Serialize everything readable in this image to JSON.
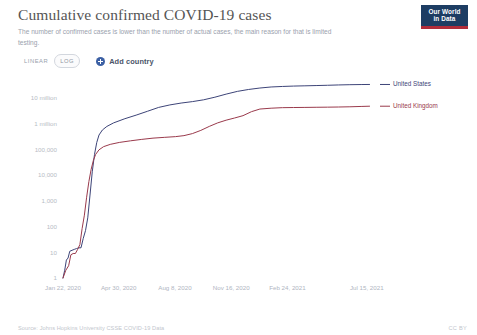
{
  "header": {
    "title": "Cumulative confirmed COVID-19 cases",
    "subtitle": "The number of confirmed cases is lower than the number of actual cases, the main reason for that is limited testing.",
    "logo_line1": "Our World",
    "logo_line2": "in Data",
    "logo_bg": "#1d3d63",
    "logo_accent": "#b02c3a"
  },
  "controls": {
    "scale_linear_label": "LINEAR",
    "scale_log_label": "LOG",
    "scale_selected": "LOG",
    "add_country_label": "Add country",
    "add_country_icon": "plus-circle-icon",
    "accent": "#3c60a4"
  },
  "footer": {
    "source": "Source: Johns Hopkins University CSSE COVID-19 Data",
    "license": "CC BY"
  },
  "chart_data": {
    "type": "line",
    "title": "Cumulative confirmed COVID-19 cases",
    "subtitle": "The number of confirmed cases is lower than the number of actual cases, the main reason for that is limited testing.",
    "xlabel": "",
    "ylabel": "",
    "yscale": "log",
    "ylim": [
      1,
      30000000
    ],
    "grid": false,
    "legend_position": "right-inline",
    "ytick_values": [
      1,
      10,
      100,
      1000,
      10000,
      100000,
      1000000,
      10000000
    ],
    "ytick_labels": [
      "1",
      "10",
      "100",
      "1,000",
      "10,000",
      "100,000",
      "1 million",
      "10 million"
    ],
    "xtick_labels": [
      "Jan 22, 2020",
      "Apr 30, 2020",
      "Aug 8, 2020",
      "Nov 16, 2020",
      "Feb 24, 2021",
      "Jul 15, 2021"
    ],
    "xtick_positions": [
      0,
      99,
      199,
      299,
      399,
      540
    ],
    "x_range": [
      0,
      560
    ],
    "series": [
      {
        "name": "United States",
        "color": "#3d4478",
        "label_color": "#3d4478",
        "points": [
          [
            0,
            1
          ],
          [
            3,
            2
          ],
          [
            6,
            5
          ],
          [
            9,
            6
          ],
          [
            12,
            11
          ],
          [
            16,
            12
          ],
          [
            20,
            13
          ],
          [
            24,
            14
          ],
          [
            28,
            15
          ],
          [
            32,
            15
          ],
          [
            36,
            35
          ],
          [
            40,
            70
          ],
          [
            44,
            220
          ],
          [
            48,
            1700
          ],
          [
            52,
            13700
          ],
          [
            56,
            65000
          ],
          [
            60,
            190000
          ],
          [
            64,
            370000
          ],
          [
            70,
            580000
          ],
          [
            78,
            800000
          ],
          [
            90,
            1100000
          ],
          [
            110,
            1600000
          ],
          [
            130,
            2200000
          ],
          [
            150,
            3100000
          ],
          [
            170,
            4400000
          ],
          [
            190,
            5500000
          ],
          [
            210,
            6500000
          ],
          [
            230,
            7400000
          ],
          [
            250,
            8700000
          ],
          [
            270,
            11000000
          ],
          [
            290,
            14500000
          ],
          [
            310,
            18500000
          ],
          [
            330,
            22000000
          ],
          [
            350,
            25000000
          ],
          [
            370,
            27500000
          ],
          [
            390,
            28800000
          ],
          [
            410,
            29800000
          ],
          [
            430,
            30500000
          ],
          [
            450,
            31200000
          ],
          [
            470,
            32000000
          ],
          [
            490,
            33000000
          ],
          [
            510,
            33700000
          ],
          [
            530,
            34200000
          ],
          [
            545,
            34400000
          ]
        ]
      },
      {
        "name": "United Kingdom",
        "color": "#9a3a4c",
        "label_color": "#9a3a4c",
        "points": [
          [
            0,
            1
          ],
          [
            5,
            2
          ],
          [
            10,
            3
          ],
          [
            14,
            8
          ],
          [
            18,
            9
          ],
          [
            22,
            9
          ],
          [
            26,
            13
          ],
          [
            30,
            20
          ],
          [
            34,
            85
          ],
          [
            38,
            280
          ],
          [
            42,
            1400
          ],
          [
            46,
            5700
          ],
          [
            50,
            17000
          ],
          [
            54,
            38000
          ],
          [
            58,
            65000
          ],
          [
            64,
            98000
          ],
          [
            72,
            130000
          ],
          [
            84,
            160000
          ],
          [
            100,
            190000
          ],
          [
            120,
            220000
          ],
          [
            140,
            250000
          ],
          [
            160,
            280000
          ],
          [
            180,
            300000
          ],
          [
            200,
            320000
          ],
          [
            215,
            350000
          ],
          [
            230,
            420000
          ],
          [
            245,
            560000
          ],
          [
            260,
            800000
          ],
          [
            275,
            1100000
          ],
          [
            290,
            1400000
          ],
          [
            305,
            1700000
          ],
          [
            320,
            2100000
          ],
          [
            335,
            3000000
          ],
          [
            350,
            3800000
          ],
          [
            370,
            4100000
          ],
          [
            390,
            4300000
          ],
          [
            410,
            4350000
          ],
          [
            430,
            4400000
          ],
          [
            450,
            4450000
          ],
          [
            470,
            4500000
          ],
          [
            490,
            4560000
          ],
          [
            510,
            4650000
          ],
          [
            530,
            4800000
          ],
          [
            545,
            4900000
          ]
        ]
      }
    ]
  }
}
